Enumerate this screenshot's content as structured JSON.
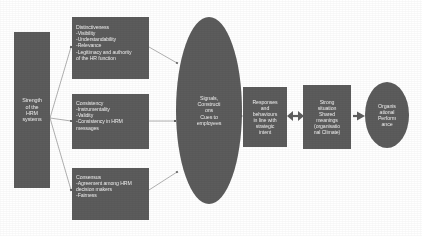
{
  "diagram": {
    "background_color": "#ffffff",
    "shape_fill": "#575757",
    "text_color": "#f2f2f2",
    "connector_color": "#8e8e8e",
    "nodes": {
      "strength": {
        "label": "Strength\nof the\nHRM\nsystems",
        "shape": "rectangle"
      },
      "distinctiveness": {
        "label": "Distinctiveness\n-Visibility\n-Understandability\n-Relevance\n-Legitimacy and authority\nof the HR function",
        "shape": "rectangle"
      },
      "consistency": {
        "label": "Consistency\n-Instrumentality\n-Validity\n-Consistency in HRM\nmessages",
        "shape": "rectangle"
      },
      "consensus": {
        "label": "Consensus\n-Agreement among HRM\ndecision makers\n-Fairness",
        "shape": "rectangle"
      },
      "signals": {
        "label": "Signals,\nConstructi\nons\nCues to\nemployees",
        "shape": "ellipse"
      },
      "responses": {
        "label": "Responses\nand\nbehaviours\nin line with\nstrategic\nintent",
        "shape": "rectangle"
      },
      "strong_situation": {
        "label": "Strong\nsituation\nShared\nmeanings\n(organisatio\nnal Climate)",
        "shape": "rectangle"
      },
      "performance": {
        "label": "Organis\national\nPerform\nance",
        "shape": "ellipse"
      }
    },
    "connectors": [
      {
        "from": "strength",
        "to": "distinctiveness",
        "style": "line-arrow"
      },
      {
        "from": "strength",
        "to": "consistency",
        "style": "line-arrow"
      },
      {
        "from": "strength",
        "to": "consensus",
        "style": "line-arrow"
      },
      {
        "from": "distinctiveness",
        "to": "signals",
        "style": "line-arrow"
      },
      {
        "from": "consistency",
        "to": "signals",
        "style": "line-arrow"
      },
      {
        "from": "consensus",
        "to": "signals",
        "style": "line-arrow"
      },
      {
        "from": "signals",
        "to": "responses",
        "style": "block-arrow"
      },
      {
        "from": "responses",
        "to": "strong_situation",
        "style": "block-arrow-double"
      },
      {
        "from": "strong_situation",
        "to": "performance",
        "style": "block-arrow"
      }
    ]
  }
}
